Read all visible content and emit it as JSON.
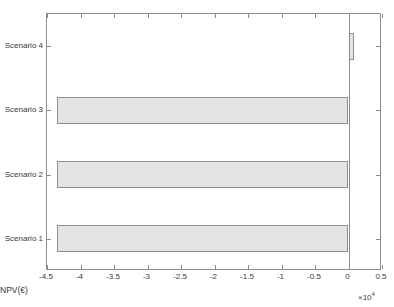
{
  "chart_data": {
    "type": "bar",
    "orientation": "horizontal",
    "title": "",
    "xlabel": "NPV(€)",
    "ylabel": "",
    "categories": [
      "Scenario 1",
      "Scenario 2",
      "Scenario 3",
      "Scenario 4"
    ],
    "values": [
      -43500,
      -43500,
      -43500,
      800
    ],
    "exponent_label": "×10",
    "exponent_power": "4",
    "exponent_multiplier": 10000,
    "xlim": [
      -45000,
      5000
    ],
    "xticks": [
      -45000,
      -40000,
      -35000,
      -30000,
      -25000,
      -20000,
      -15000,
      -10000,
      -5000,
      0,
      5000
    ],
    "xticklabels": [
      "-4.5",
      "-4",
      "-3.5",
      "-3",
      "-2.5",
      "-2",
      "-1.5",
      "-1",
      "-0.5",
      "0",
      "0.5"
    ],
    "grid": false,
    "legend": null,
    "bar_fill_color": "#e4e4e4",
    "bar_edge_color": "#8f8f8f",
    "axes_color": "#8c8c8c",
    "background_color": "#ffffff"
  }
}
